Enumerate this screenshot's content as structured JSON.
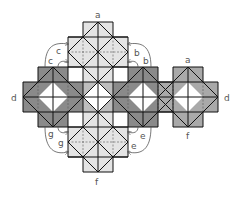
{
  "diagram": {
    "type": "net-of-polyhedron-tiling",
    "colors": {
      "light": "#e4e4e4",
      "medium": "#a9a9a9",
      "dark": "#8a8a8a",
      "hole": "#ffffff",
      "edge": "#111111",
      "dash": "#555555",
      "arrow": "#555555"
    },
    "labels": {
      "top_a": "a",
      "right_a": "a",
      "c_outer": "c",
      "c_inner": "c",
      "b_outer": "b",
      "b_inner": "b",
      "d_left": "d",
      "d_right": "d",
      "g_outer": "g",
      "g_inner": "g",
      "e_outer": "e",
      "e_inner": "e",
      "f_bottom": "f",
      "f_right": "f"
    }
  }
}
